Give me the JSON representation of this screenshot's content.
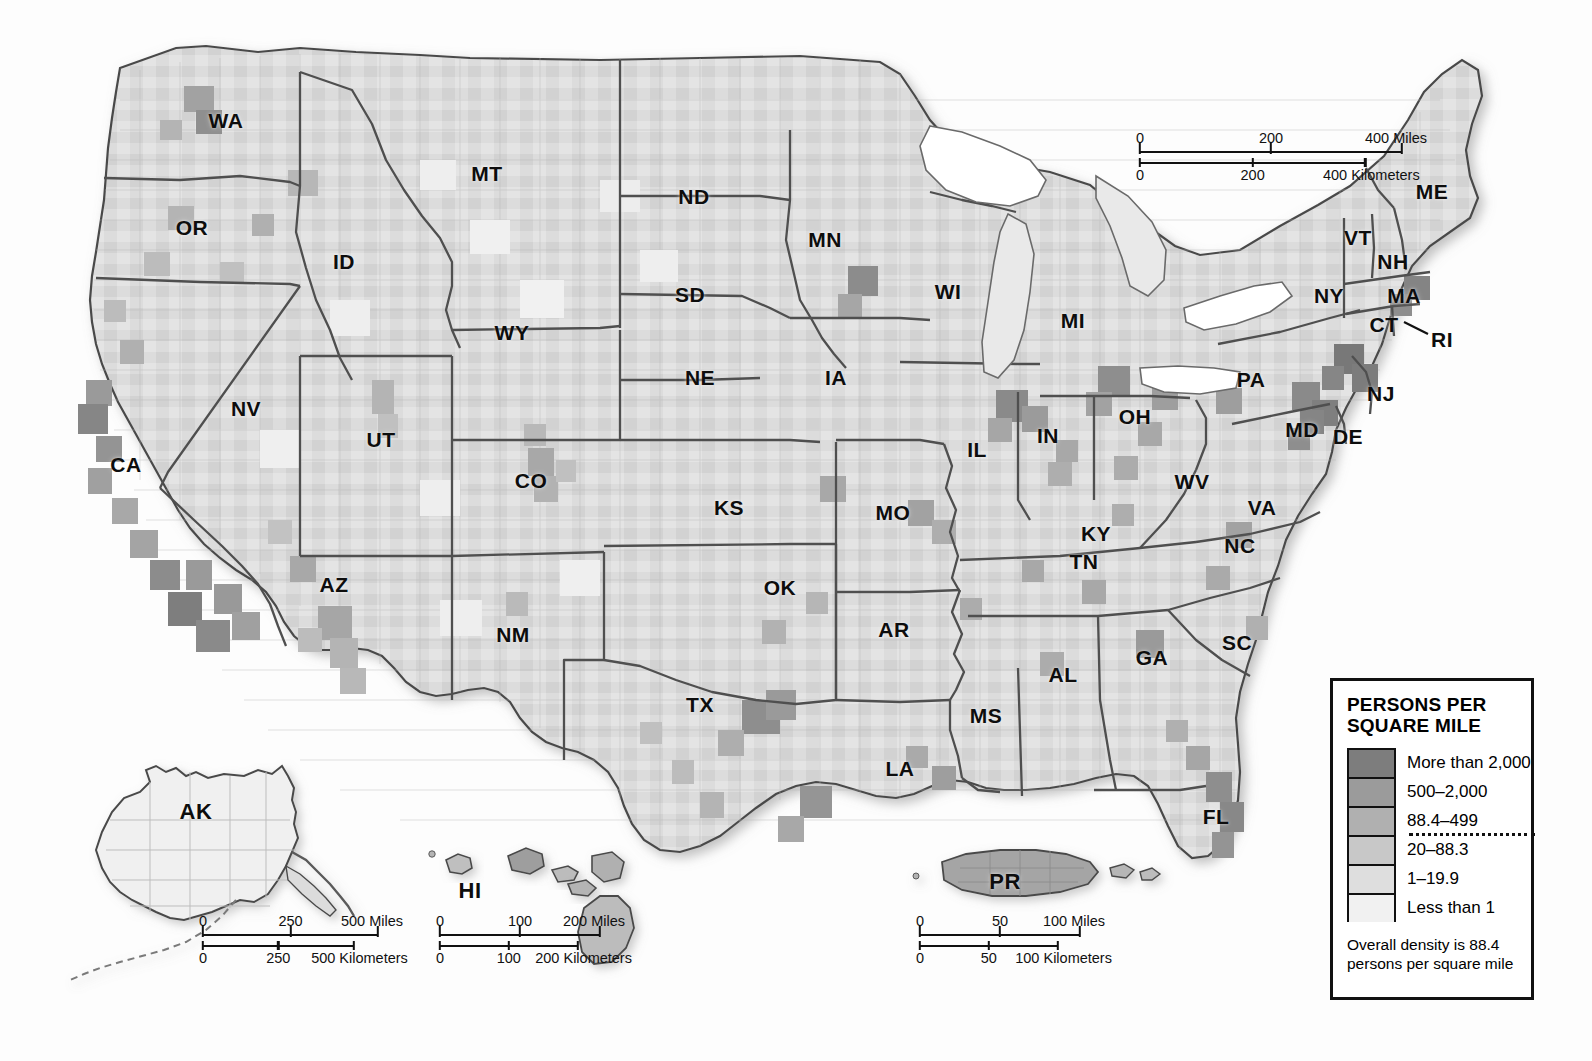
{
  "map": {
    "title_semantic": "United States population density by county",
    "background_color": "#fdfdfd",
    "land_outline_color": "#4a4a4a",
    "state_border_color": "#4f4f4f",
    "county_border_color": "#b9b9b9",
    "state_labels": [
      {
        "abbr": "WA",
        "x": 226,
        "y": 121
      },
      {
        "abbr": "OR",
        "x": 192,
        "y": 228
      },
      {
        "abbr": "ID",
        "x": 344,
        "y": 262
      },
      {
        "abbr": "MT",
        "x": 487,
        "y": 174
      },
      {
        "abbr": "ND",
        "x": 694,
        "y": 197
      },
      {
        "abbr": "SD",
        "x": 690,
        "y": 295
      },
      {
        "abbr": "MN",
        "x": 825,
        "y": 240
      },
      {
        "abbr": "WI",
        "x": 948,
        "y": 292
      },
      {
        "abbr": "MI",
        "x": 1073,
        "y": 321
      },
      {
        "abbr": "WY",
        "x": 512,
        "y": 333
      },
      {
        "abbr": "NV",
        "x": 246,
        "y": 409
      },
      {
        "abbr": "UT",
        "x": 381,
        "y": 440
      },
      {
        "abbr": "CO",
        "x": 531,
        "y": 481
      },
      {
        "abbr": "NE",
        "x": 700,
        "y": 378
      },
      {
        "abbr": "IA",
        "x": 836,
        "y": 378
      },
      {
        "abbr": "IL",
        "x": 977,
        "y": 450
      },
      {
        "abbr": "IN",
        "x": 1048,
        "y": 436
      },
      {
        "abbr": "OH",
        "x": 1135,
        "y": 417
      },
      {
        "abbr": "PA",
        "x": 1251,
        "y": 380
      },
      {
        "abbr": "NY",
        "x": 1329,
        "y": 296
      },
      {
        "abbr": "VT",
        "x": 1358,
        "y": 238
      },
      {
        "abbr": "NH",
        "x": 1393,
        "y": 262
      },
      {
        "abbr": "ME",
        "x": 1432,
        "y": 192
      },
      {
        "abbr": "MA",
        "x": 1404,
        "y": 296
      },
      {
        "abbr": "CT",
        "x": 1384,
        "y": 325
      },
      {
        "abbr": "RI",
        "x": 1442,
        "y": 340
      },
      {
        "abbr": "NJ",
        "x": 1381,
        "y": 394
      },
      {
        "abbr": "MD",
        "x": 1302,
        "y": 430
      },
      {
        "abbr": "DE",
        "x": 1348,
        "y": 437
      },
      {
        "abbr": "WV",
        "x": 1192,
        "y": 482
      },
      {
        "abbr": "VA",
        "x": 1262,
        "y": 508
      },
      {
        "abbr": "KY",
        "x": 1096,
        "y": 534
      },
      {
        "abbr": "CA",
        "x": 126,
        "y": 465
      },
      {
        "abbr": "AZ",
        "x": 334,
        "y": 585
      },
      {
        "abbr": "NM",
        "x": 513,
        "y": 635
      },
      {
        "abbr": "KS",
        "x": 729,
        "y": 508
      },
      {
        "abbr": "MO",
        "x": 893,
        "y": 513
      },
      {
        "abbr": "OK",
        "x": 780,
        "y": 588
      },
      {
        "abbr": "AR",
        "x": 894,
        "y": 630
      },
      {
        "abbr": "TN",
        "x": 1084,
        "y": 562
      },
      {
        "abbr": "NC",
        "x": 1240,
        "y": 546
      },
      {
        "abbr": "SC",
        "x": 1237,
        "y": 643
      },
      {
        "abbr": "GA",
        "x": 1152,
        "y": 658
      },
      {
        "abbr": "AL",
        "x": 1063,
        "y": 675
      },
      {
        "abbr": "MS",
        "x": 986,
        "y": 716
      },
      {
        "abbr": "LA",
        "x": 900,
        "y": 769
      },
      {
        "abbr": "TX",
        "x": 700,
        "y": 705
      },
      {
        "abbr": "FL",
        "x": 1216,
        "y": 817
      }
    ],
    "inset_labels": [
      {
        "abbr": "AK",
        "x": 196,
        "y": 812
      },
      {
        "abbr": "HI",
        "x": 470,
        "y": 891
      },
      {
        "abbr": "PR",
        "x": 1005,
        "y": 882
      }
    ]
  },
  "scalebars": {
    "main": {
      "name": "main-scale-bar",
      "miles": {
        "ticks": [
          "0",
          "200",
          "400 Miles"
        ],
        "max": 400,
        "unit": "Miles"
      },
      "kilometers": {
        "ticks": [
          "0",
          "200",
          "400 Kilometers"
        ],
        "max": 400,
        "unit": "Kilometers"
      }
    },
    "alaska": {
      "name": "alaska-scale-bar",
      "miles": {
        "ticks": [
          "0",
          "250",
          "500 Miles"
        ],
        "max": 500,
        "unit": "Miles"
      },
      "kilometers": {
        "ticks": [
          "0",
          "250",
          "500 Kilometers"
        ],
        "max": 500,
        "unit": "Kilometers"
      }
    },
    "hawaii": {
      "name": "hawaii-scale-bar",
      "miles": {
        "ticks": [
          "0",
          "100",
          "200 Miles"
        ],
        "max": 200,
        "unit": "Miles"
      },
      "kilometers": {
        "ticks": [
          "0",
          "100",
          "200 Kilometers"
        ],
        "max": 200,
        "unit": "Kilometers"
      }
    },
    "puertorico": {
      "name": "puerto-rico-scale-bar",
      "miles": {
        "ticks": [
          "0",
          "50",
          "100 Miles"
        ],
        "max": 100,
        "unit": "Miles"
      },
      "kilometers": {
        "ticks": [
          "0",
          "50",
          "100 Kilometers"
        ],
        "max": 100,
        "unit": "Kilometers"
      }
    }
  },
  "legend": {
    "title": "PERSONS PER\nSQUARE MILE",
    "classes": [
      {
        "label": "More than 2,000",
        "color": "#7d7d7d"
      },
      {
        "label": "500–2,000",
        "color": "#9b9b9b"
      },
      {
        "label": "88.4–499",
        "color": "#b0b0b0"
      },
      {
        "label": "20–88.3",
        "color": "#c8c8c8"
      },
      {
        "label": "1–19.9",
        "color": "#dedede"
      },
      {
        "label": "Less than 1",
        "color": "#f1f1f1"
      }
    ],
    "dotted_separator_after_index": 2,
    "note": "Overall density is 88.4\npersons per square mile"
  },
  "chart_data": {
    "type": "map",
    "title": "PERSONS PER SQUARE MILE",
    "measure": "Population density (persons per square mile)",
    "unit": "persons per square mile",
    "geography": "United States counties, 50 states + Puerto Rico",
    "overall_density": 88.4,
    "class_breaks": [
      {
        "label": "More than 2,000",
        "min": 2000,
        "max": null,
        "color": "#7d7d7d"
      },
      {
        "label": "500-2,000",
        "min": 500,
        "max": 2000,
        "color": "#9b9b9b"
      },
      {
        "label": "88.4-499",
        "min": 88.4,
        "max": 499,
        "color": "#b0b0b0"
      },
      {
        "label": "20-88.3",
        "min": 20,
        "max": 88.3,
        "color": "#c8c8c8"
      },
      {
        "label": "1-19.9",
        "min": 1,
        "max": 19.9,
        "color": "#dedede"
      },
      {
        "label": "Less than 1",
        "min": 0,
        "max": 1,
        "color": "#f1f1f1"
      }
    ],
    "legend_position": "bottom-right",
    "insets": [
      "AK",
      "HI",
      "PR"
    ],
    "annotations": [
      "Overall density is 88.4 persons per square mile"
    ]
  }
}
